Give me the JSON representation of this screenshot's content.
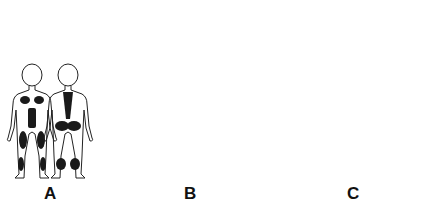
{
  "diagram": {
    "panels": [
      {
        "label": "A",
        "subject": "child",
        "views": [
          "front",
          "back"
        ],
        "shaded_regions_front": [
          "pectoral",
          "abdomen",
          "thighs",
          "calves"
        ],
        "shaded_regions_back": [
          "spine",
          "gluteal",
          "calves"
        ]
      },
      {
        "label": "B",
        "subject": "adult",
        "views": [
          "front",
          "back"
        ],
        "shaded_regions_front": [
          "shoulders",
          "pectoral"
        ],
        "shaded_regions_back": [
          "shoulders",
          "neck",
          "spine",
          "gluteal"
        ]
      },
      {
        "label": "C",
        "subject": "adult",
        "views": [
          "front",
          "back"
        ],
        "shaded_regions_front": [
          "face",
          "shoulders",
          "pectoral",
          "calves"
        ],
        "shaded_regions_back": [
          "neck",
          "shoulders",
          "upper-back"
        ]
      }
    ]
  },
  "colors": {
    "outline": "#222222",
    "shade": "#1a1a1a",
    "background": "#ffffff"
  }
}
